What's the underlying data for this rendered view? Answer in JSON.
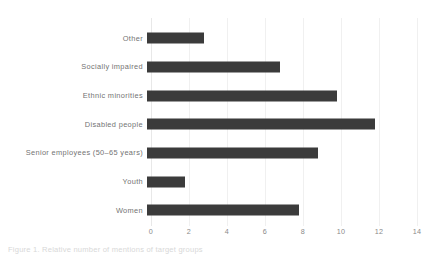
{
  "chart_data": {
    "type": "bar",
    "orientation": "horizontal",
    "title": "",
    "xlabel": "",
    "ylabel": "",
    "xlim": [
      0,
      14
    ],
    "xticks": [
      0,
      2,
      4,
      6,
      8,
      10,
      12,
      14
    ],
    "xtick_labels": [
      "0",
      "2",
      "4",
      "6",
      "8",
      "10",
      "12",
      "14"
    ],
    "grid": true,
    "grid_axis": "x",
    "legend": false,
    "bar_color": "#3b3b3b",
    "background_color": "#ffffff",
    "categories": [
      "Other",
      "Socially impaired",
      "Ethnic minorities",
      "Disabled people",
      "Senior employees (50–65 years)",
      "Youth",
      "Women"
    ],
    "values": [
      3,
      7,
      10,
      12,
      9,
      2,
      8
    ]
  },
  "caption": {
    "text": "Figure 1. Relative number of mentions of target groups"
  }
}
